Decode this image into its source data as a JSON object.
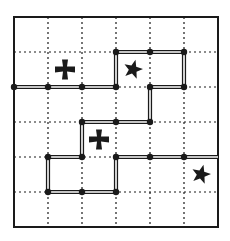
{
  "puzzle": {
    "grid": {
      "cols": 6,
      "rows": 6,
      "left": 14,
      "top": 17,
      "cell_w": 34,
      "cell_h": 35
    },
    "colors": {
      "ink": "#1a1a1a",
      "paper": "#ffffff",
      "stick_fill": "#ffffff"
    },
    "matchsticks": [
      {
        "from": [
          0,
          2
        ],
        "to": [
          1,
          2
        ]
      },
      {
        "from": [
          1,
          2
        ],
        "to": [
          2,
          2
        ]
      },
      {
        "from": [
          2,
          2
        ],
        "to": [
          3,
          2
        ]
      },
      {
        "from": [
          3,
          2
        ],
        "to": [
          3,
          1
        ]
      },
      {
        "from": [
          3,
          1
        ],
        "to": [
          4,
          1
        ]
      },
      {
        "from": [
          4,
          1
        ],
        "to": [
          5,
          1
        ]
      },
      {
        "from": [
          5,
          1
        ],
        "to": [
          5,
          2
        ]
      },
      {
        "from": [
          5,
          2
        ],
        "to": [
          4,
          2
        ]
      },
      {
        "from": [
          4,
          2
        ],
        "to": [
          4,
          3
        ]
      },
      {
        "from": [
          4,
          3
        ],
        "to": [
          3,
          3
        ]
      },
      {
        "from": [
          3,
          3
        ],
        "to": [
          2,
          3
        ]
      },
      {
        "from": [
          2,
          3
        ],
        "to": [
          2,
          4
        ]
      },
      {
        "from": [
          2,
          4
        ],
        "to": [
          1,
          4
        ]
      },
      {
        "from": [
          1,
          4
        ],
        "to": [
          1,
          5
        ]
      },
      {
        "from": [
          1,
          5
        ],
        "to": [
          2,
          5
        ]
      },
      {
        "from": [
          2,
          5
        ],
        "to": [
          3,
          5
        ]
      },
      {
        "from": [
          3,
          5
        ],
        "to": [
          3,
          4
        ]
      },
      {
        "from": [
          3,
          4
        ],
        "to": [
          4,
          4
        ]
      },
      {
        "from": [
          4,
          4
        ],
        "to": [
          5,
          4
        ]
      },
      {
        "from": [
          5,
          4
        ],
        "to": [
          6,
          4
        ]
      }
    ],
    "symbols": [
      {
        "type": "cross",
        "col": 1,
        "row": 1
      },
      {
        "type": "star",
        "col": 3,
        "row": 1
      },
      {
        "type": "cross",
        "col": 2,
        "row": 3
      },
      {
        "type": "star",
        "col": 5,
        "row": 4
      }
    ]
  }
}
